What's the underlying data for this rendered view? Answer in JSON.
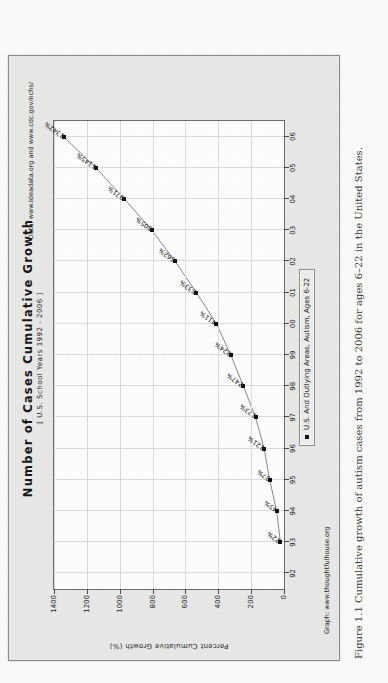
{
  "chart_data": {
    "type": "line",
    "title": "Number of Cases Cumulative Growth",
    "subtitle": "[ U.S. School Years 1992 - 2006 ]",
    "xlabel": "",
    "ylabel": "Percent Cumulative Growth (%)",
    "ylim": [
      0,
      1400
    ],
    "yticks": [
      0,
      200,
      400,
      600,
      800,
      1000,
      1200,
      1400
    ],
    "ytick_labels": [
      "0",
      "200",
      "400",
      "600",
      "800",
      "1000",
      "1200",
      "1400"
    ],
    "xticks": [
      "92",
      "93",
      "94",
      "95",
      "96",
      "97",
      "98",
      "99",
      "00",
      "01",
      "02",
      "03",
      "04",
      "05",
      "06"
    ],
    "grid": true,
    "legend_position": "bottom-center",
    "series": [
      {
        "name": "U.S. And Outlying Areas, Autism, Ages 6-22",
        "x": [
          "93",
          "94",
          "95",
          "96",
          "97",
          "98",
          "99",
          "00",
          "01",
          "02",
          "03",
          "04",
          "05",
          "06"
        ],
        "values": [
          22,
          45,
          87,
          121,
          173,
          247,
          324,
          411,
          533,
          662,
          805,
          971,
          1145,
          1342
        ],
        "point_labels": [
          "22%",
          "45%",
          "87%",
          "121%",
          "173%",
          "247%",
          "324%",
          "411%",
          "533%",
          "662%",
          "805%",
          "971%",
          "1145%",
          "1342%"
        ],
        "marker": "square",
        "color": "#111111"
      }
    ],
    "annotations": {
      "source_graph": "Graph: www.thoughtfulhouse.org",
      "source_data": "Data: www.ideadata.org and www.cdc.gov/nchs/"
    }
  },
  "legend": {
    "marker_name": "legend-marker",
    "label": "U.S. And Outlying Areas, Autism, Ages 6-22"
  },
  "footer": {
    "graph_source": "Graph: www.thoughtfulhouse.org",
    "data_source": "Data: www.ideadata.org and www.cdc.gov/nchs/"
  },
  "caption": {
    "text": "Figure 1.1 Cumulative growth of autism cases from 1992 to 2006 for ages 6–22 in the United States."
  },
  "colors": {
    "figure_background": "#e9e9e7",
    "plot_background": "#ffffff",
    "grid": "#dcdcdc",
    "line": "#8a8a8a",
    "marker": "#111111",
    "page": "#fcfcfa"
  }
}
